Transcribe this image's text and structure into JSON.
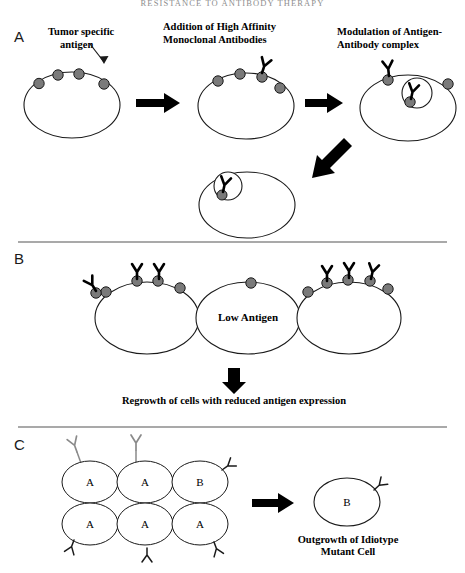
{
  "running_head": "RESISTANCE TO ANTIBODY THERAPY",
  "colors": {
    "antigen_fill": "#7a7a7a",
    "antigen_stroke": "#1a1a1a",
    "antibody_bound": "#000000",
    "antibody_free": "#8a8a8a",
    "cell_stroke": "#1a1a1a",
    "arrow": "#000000",
    "divider": "#555555",
    "text": "#000000",
    "running_head": "#8e8e8e"
  },
  "panels": {
    "a": {
      "letter": "A",
      "captions": {
        "antigen": "Tumor specific\nantigen",
        "antigen_line1": "Tumor specific",
        "antigen_line2": "antigen",
        "addition_line1": "Addition of High Affinity",
        "addition_line2": "Monoclonal Antibodies",
        "modulation_line1": "Modulation of Antigen-",
        "modulation_line2": "Antibody complex"
      },
      "cells": [
        {
          "name": "cell-naive",
          "antigens": 4,
          "antibodies": 0,
          "internalized": 0
        },
        {
          "name": "cell-antibody-bound",
          "antigens": 4,
          "antibodies": 1,
          "internalized": 0
        },
        {
          "name": "cell-modulating",
          "antigens": 3,
          "antibodies": 1,
          "internalized": 1
        },
        {
          "name": "cell-internalized",
          "antigens": 1,
          "antibodies": 0,
          "internalized": 1
        }
      ]
    },
    "b": {
      "letter": "B",
      "cells": [
        {
          "name": "cell-high-antigen-left",
          "label": "",
          "antigens": 4,
          "antibodies": 3
        },
        {
          "name": "cell-low-antigen",
          "label": "Low Antigen",
          "antigens": 1,
          "antibodies": 0
        },
        {
          "name": "cell-high-antigen-right",
          "label": "",
          "antigens": 4,
          "antibodies": 3
        }
      ],
      "low_antigen_label": "Low Antigen",
      "regrowth_caption": "Regrowth of cells with reduced antigen expression"
    },
    "c": {
      "letter": "C",
      "grid_labels": [
        [
          "A",
          "A",
          "B"
        ],
        [
          "A",
          "A",
          "A"
        ]
      ],
      "mutant_cell_label": "B",
      "outgrowth_line1": "Outgrowth of Idiotype",
      "outgrowth_line2": "Mutant Cell"
    }
  }
}
